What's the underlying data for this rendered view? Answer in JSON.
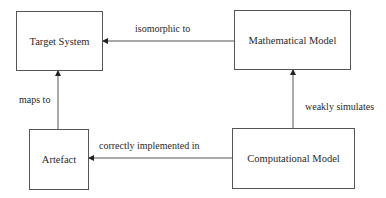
{
  "diagram": {
    "nodes": {
      "target_system": {
        "label": "Target System"
      },
      "mathematical_model": {
        "label": "Mathematical Model"
      },
      "artefact": {
        "label": "Artefact"
      },
      "computational_model": {
        "label": "Computational Model"
      }
    },
    "edges": {
      "isomorphic": {
        "label": "isomorphic to",
        "from": "Mathematical Model",
        "to": "Target System"
      },
      "maps": {
        "label": "maps to",
        "from": "Artefact",
        "to": "Target System"
      },
      "simulates": {
        "label": "weakly simulates",
        "from": "Computational Model",
        "to": "Mathematical Model"
      },
      "implemented": {
        "label": "correctly implemented in",
        "from": "Computational Model",
        "to": "Artefact"
      }
    },
    "colors": {
      "line": "#555555",
      "text": "#2a2a2a",
      "background": "#ffffff"
    }
  }
}
